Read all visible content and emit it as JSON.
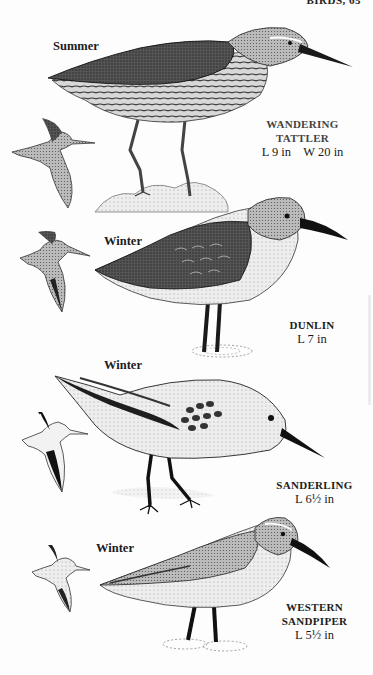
{
  "running_head": "BIRDS, 65",
  "plates": [
    {
      "species": "WANDERING TATTLER",
      "name_lines": [
        "WANDERING",
        "TATTLER"
      ],
      "season": "Summer",
      "measurements": "L 9 in    W 20 in",
      "figures": [
        "standing-adult",
        "flight"
      ]
    },
    {
      "species": "DUNLIN",
      "name_lines": [
        "DUNLIN"
      ],
      "season": "Winter",
      "measurements": "L 7 in",
      "figures": [
        "standing-adult",
        "flight"
      ]
    },
    {
      "species": "SANDERLING",
      "name_lines": [
        "SANDERLING"
      ],
      "season": "Winter",
      "measurements": "L 6½ in",
      "figures": [
        "standing-adult",
        "flight"
      ]
    },
    {
      "species": "WESTERN SANDPIPER",
      "name_lines": [
        "WESTERN",
        "SANDPIPER"
      ],
      "season": "Winter",
      "measurements": "L 5½ in",
      "figures": [
        "standing-adult",
        "flight"
      ]
    }
  ],
  "colors": {
    "ink": "#1a1a1a",
    "stipple_dark": "#3a3a3a",
    "stipple_mid": "#8a8a8a",
    "stipple_light": "#cfcfcf",
    "paper": "#fdfdfd"
  }
}
